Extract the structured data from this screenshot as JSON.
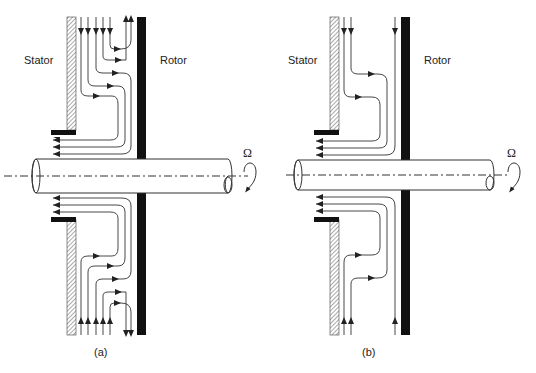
{
  "figure": {
    "panels": [
      {
        "id": "a",
        "caption": "(a)",
        "labels": {
          "stator": "Stator",
          "rotor": "Rotor",
          "rotation": "Ω"
        },
        "description": "Rotor-stator cavity with radial inflow and outflow: five inlet streams enter from outer radius; two recirculate outward along rotor, three exit at inner radius below stator foot"
      },
      {
        "id": "b",
        "caption": "(b)",
        "labels": {
          "stator": "Stator",
          "rotor": "Rotor",
          "rotation": "Ω"
        },
        "description": "Rotor-stator cavity with three inflow streams from outer radius, all exiting at inner radius below stator foot"
      }
    ],
    "colors": {
      "line": "#333333",
      "rotor": "#111111",
      "hatch": "#555555",
      "background": "#ffffff"
    }
  }
}
